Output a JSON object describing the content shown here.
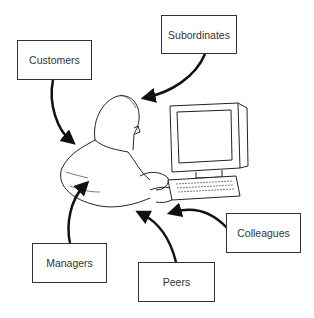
{
  "diagram": {
    "center": "person-at-computer",
    "labels": {
      "customers": "Customers",
      "subordinates": "Subordinates",
      "managers": "Managers",
      "peers": "Peers",
      "colleagues": "Colleagues"
    }
  }
}
